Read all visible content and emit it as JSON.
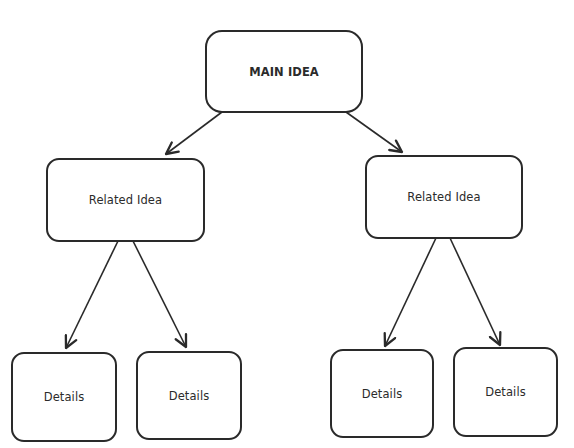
{
  "diagram": {
    "type": "hierarchy tree",
    "nodes": [
      {
        "id": "main",
        "label": "MAIN IDEA",
        "level": 0,
        "x": 205,
        "y": 30,
        "w": 158,
        "h": 83
      },
      {
        "id": "related_left",
        "label": "Related Idea",
        "level": 1,
        "parent": "main",
        "x": 46,
        "y": 158,
        "w": 159,
        "h": 84
      },
      {
        "id": "related_right",
        "label": "Related Idea",
        "level": 1,
        "parent": "main",
        "x": 365,
        "y": 155,
        "w": 158,
        "h": 84
      },
      {
        "id": "details_1",
        "label": "Details",
        "level": 2,
        "parent": "related_left",
        "x": 11,
        "y": 352,
        "w": 106,
        "h": 90
      },
      {
        "id": "details_2",
        "label": "Details",
        "level": 2,
        "parent": "related_left",
        "x": 136,
        "y": 351,
        "w": 106,
        "h": 89
      },
      {
        "id": "details_3",
        "label": "Details",
        "level": 2,
        "parent": "related_right",
        "x": 330,
        "y": 349,
        "w": 104,
        "h": 89
      },
      {
        "id": "details_4",
        "label": "Details",
        "level": 2,
        "parent": "related_right",
        "x": 453,
        "y": 347,
        "w": 105,
        "h": 90
      }
    ],
    "edges": [
      {
        "from": "main",
        "to": "related_left",
        "x1": 222,
        "y1": 112,
        "x2": 166,
        "y2": 154
      },
      {
        "from": "main",
        "to": "related_right",
        "x1": 346,
        "y1": 112,
        "x2": 402,
        "y2": 152
      },
      {
        "from": "related_left",
        "to": "details_1",
        "x1": 118,
        "y1": 241,
        "x2": 66,
        "y2": 348
      },
      {
        "from": "related_left",
        "to": "details_2",
        "x1": 133,
        "y1": 241,
        "x2": 186,
        "y2": 347
      },
      {
        "from": "related_right",
        "to": "details_3",
        "x1": 436,
        "y1": 238,
        "x2": 385,
        "y2": 346
      },
      {
        "from": "related_right",
        "to": "details_4",
        "x1": 450,
        "y1": 238,
        "x2": 500,
        "y2": 345
      }
    ],
    "colors": {
      "stroke": "#2a2a2a",
      "background": "#ffffff",
      "text": "#2b2b2b"
    }
  }
}
